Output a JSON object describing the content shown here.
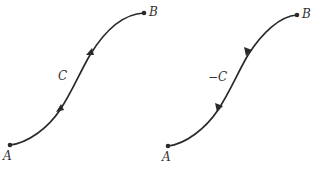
{
  "diagram": {
    "left_panel": {
      "curve_label": "C",
      "start_label": "A",
      "end_label": "B",
      "orientation": "A to B"
    },
    "right_panel": {
      "curve_label": "−C",
      "start_label": "A",
      "end_label": "B",
      "orientation": "B to A"
    },
    "colors": {
      "stroke": "#2a2a2a",
      "text": "#333333",
      "background": "#ffffff"
    }
  }
}
